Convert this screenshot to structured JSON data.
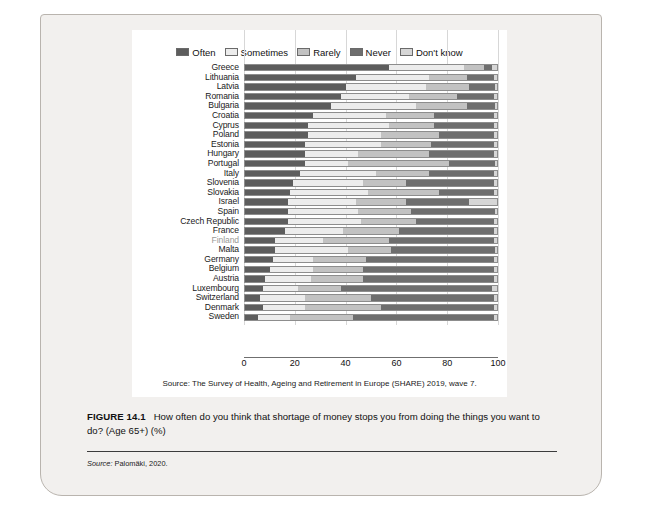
{
  "figure": {
    "number": "FIGURE 14.1",
    "caption": "How often do you think that shortage of money stops you from doing the things you want to do? (Age 65+) (%)",
    "source": "Source:",
    "source_text": "Palomäki, 2020.",
    "chart_source": "Source: The Survey of Health, Ageing and Retirement in Europe (SHARE) 2019, wave 7.",
    "highlight_country": "Finland",
    "highlight_color": "#9a9a96"
  },
  "chart_data": {
    "type": "bar",
    "orientation": "horizontal",
    "stacked": true,
    "title": "How often do you think that shortage of money stops you from doing the things you want to do? (Age 65+) (%)",
    "xlabel": "",
    "ylabel": "",
    "xlim": [
      0,
      100
    ],
    "xticks": [
      0,
      20,
      40,
      60,
      80,
      100
    ],
    "grid": true,
    "legend_position": "top",
    "legend": [
      "Often",
      "Sometimes",
      "Rarely",
      "Never",
      "Don't know"
    ],
    "colors": {
      "Often": "#5d5d5d",
      "Sometimes": "#ececec",
      "Rarely": "#c2c2c2",
      "Never": "#6e6e6e",
      "Don't know": "#d6d6d6"
    },
    "categories": [
      "Greece",
      "Lithuania",
      "Latvia",
      "Romania",
      "Bulgaria",
      "Croatia",
      "Cyprus",
      "Poland",
      "Estonia",
      "Hungary",
      "Portugal",
      "Italy",
      "Slovenia",
      "Slovakia",
      "Israel",
      "Spain",
      "Czech Republic",
      "France",
      "Finland",
      "Malta",
      "Germany",
      "Belgium",
      "Austria",
      "Luxembourg",
      "Switzerland",
      "Denmark",
      "Sweden"
    ],
    "series": [
      {
        "name": "Often",
        "values": [
          57,
          44,
          40,
          38,
          34,
          27,
          25,
          25,
          24,
          24,
          24,
          22,
          19,
          18,
          17,
          17,
          17,
          16,
          12,
          12,
          11,
          10,
          8,
          7,
          6,
          7,
          5
        ]
      },
      {
        "name": "Sometimes",
        "values": [
          30,
          29,
          32,
          27,
          34,
          29,
          32,
          29,
          30,
          21,
          17,
          30,
          28,
          31,
          27,
          28,
          29,
          23,
          19,
          29,
          16,
          17,
          18,
          14,
          18,
          17,
          13
        ]
      },
      {
        "name": "Rarely",
        "values": [
          8,
          15,
          17,
          19,
          20,
          19,
          18,
          23,
          20,
          28,
          40,
          21,
          17,
          28,
          20,
          21,
          22,
          22,
          26,
          17,
          21,
          20,
          21,
          17,
          26,
          30,
          25
        ]
      },
      {
        "name": "Never",
        "values": [
          3,
          11,
          10,
          15,
          11,
          24,
          24,
          22,
          25,
          26,
          18,
          26,
          35,
          22,
          25,
          33,
          31,
          38,
          42,
          41,
          51,
          52,
          52,
          60,
          49,
          45,
          56
        ]
      },
      {
        "name": "Don't know",
        "values": [
          2,
          1,
          1,
          1,
          1,
          1,
          1,
          1,
          1,
          1,
          1,
          1,
          1,
          1,
          11,
          1,
          1,
          1,
          1,
          1,
          1,
          1,
          1,
          2,
          1,
          1,
          1
        ]
      }
    ]
  }
}
